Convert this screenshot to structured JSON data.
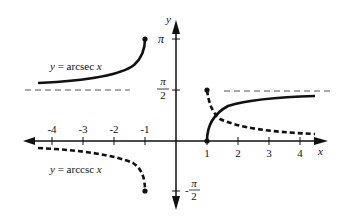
{
  "figure": {
    "axes": {
      "x_label": "x",
      "y_label": "y",
      "x_ticks": [
        "-4",
        "-3",
        "-2",
        "-1",
        "1",
        "2",
        "3",
        "4"
      ],
      "y_ticks": {
        "pi": "π",
        "pi_half_num": "π",
        "pi_half_den": "2",
        "neg_pi_half_sign": "-",
        "neg_pi_half_num": "π",
        "neg_pi_half_den": "2"
      }
    },
    "curves": [
      {
        "name": "arcsec",
        "label_prefix": "y = arcsec ",
        "label_var": "x",
        "style": "solid"
      },
      {
        "name": "arccsc",
        "label_prefix": "y = arccsc ",
        "label_var": "x",
        "style": "dashed"
      }
    ],
    "asymptote": {
      "value": "π/2",
      "style": "dashed"
    },
    "colors": {
      "ink": "#111111",
      "asymptote": "#555555",
      "background": "#ffffff"
    }
  }
}
